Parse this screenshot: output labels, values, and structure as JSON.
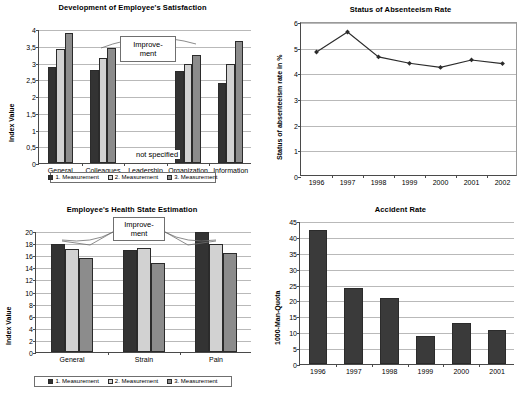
{
  "charts": [
    {
      "id": "employee-satisfaction",
      "title": "Development of Employee's Satisfaction",
      "ylabel": "Index Value",
      "annotation": "Improve-\nment",
      "annotation_line1": "Improve-",
      "annotation_line2": "ment",
      "note": "not specified",
      "legend": [
        "1. Measurement",
        "2. Measurement",
        "3. Measurement"
      ],
      "yticks": [
        "0",
        "0,5",
        "1",
        "1,5",
        "2",
        "2,5",
        "3",
        "3,5",
        "4"
      ],
      "chart_data": {
        "type": "bar",
        "title": "Development of Employee's Satisfaction",
        "xlabel": "",
        "ylabel": "Index Value",
        "ylim": [
          0,
          4
        ],
        "grid": true,
        "legend_position": "bottom",
        "categories": [
          "General",
          "Colleagues",
          "Leadership",
          "Organization",
          "Information"
        ],
        "series": [
          {
            "name": "1. Measurement",
            "color": "#333333",
            "values": [
              2.88,
              2.79,
              null,
              2.76,
              2.4
            ]
          },
          {
            "name": "2. Measurement",
            "color": "#d2d2d2",
            "values": [
              3.39,
              3.13,
              null,
              2.96,
              2.95
            ]
          },
          {
            "name": "3. Measurement",
            "color": "#8c8c8c",
            "values": [
              3.89,
              3.43,
              null,
              3.22,
              3.64
            ]
          }
        ]
      }
    },
    {
      "id": "absenteeism-rate",
      "title": "Status of Absenteeism Rate",
      "ylabel": "Status of absenteeism rate in %",
      "yticks": [
        "0",
        "1",
        "2",
        "3",
        "4",
        "5",
        "6"
      ],
      "chart_data": {
        "type": "line",
        "title": "Status of Absenteeism Rate",
        "xlabel": "",
        "ylabel": "Status of absenteeism rate in %",
        "ylim": [
          0,
          6
        ],
        "grid": true,
        "legend_position": "none",
        "marker": "diamond",
        "color": "#2b2b2b",
        "categories": [
          "1996",
          "1997",
          "1998",
          "1999",
          "2000",
          "2001",
          "2002"
        ],
        "values": [
          4.87,
          5.65,
          4.68,
          4.43,
          4.27,
          4.56,
          4.42
        ]
      }
    },
    {
      "id": "health-state",
      "title": "Employee's Health State Estimation",
      "ylabel": "Index Value",
      "annotation_line1": "Improve-",
      "annotation_line2": "ment",
      "legend": [
        "1. Measurement",
        "2. Measurement",
        "3. Measurement"
      ],
      "yticks": [
        "0",
        "2",
        "4",
        "6",
        "8",
        "10",
        "12",
        "14",
        "16",
        "18",
        "20"
      ],
      "chart_data": {
        "type": "bar",
        "title": "Employee's Health State Estimation",
        "xlabel": "",
        "ylabel": "Index Value",
        "ylim": [
          0,
          20
        ],
        "grid": true,
        "legend_position": "bottom",
        "categories": [
          "General",
          "Strain",
          "Pain"
        ],
        "series": [
          {
            "name": "1. Measurement",
            "color": "#333333",
            "values": [
              17.9,
              16.8,
              19.9
            ]
          },
          {
            "name": "2. Measurement",
            "color": "#d2d2d2",
            "values": [
              17.0,
              17.2,
              17.9
            ]
          },
          {
            "name": "3. Measurement",
            "color": "#8c8c8c",
            "values": [
              15.5,
              14.7,
              16.4
            ]
          }
        ]
      }
    },
    {
      "id": "accident-rate",
      "title": "Accident Rate",
      "ylabel": "1000-Man-Quota",
      "yticks": [
        "0",
        "5",
        "10",
        "15",
        "20",
        "25",
        "30",
        "35",
        "40",
        "45"
      ],
      "chart_data": {
        "type": "bar",
        "title": "Accident Rate",
        "xlabel": "",
        "ylabel": "1000-Man-Quota",
        "ylim": [
          0,
          45
        ],
        "grid": true,
        "legend_position": "none",
        "categories": [
          "1996",
          "1997",
          "1998",
          "1999",
          "2000",
          "2001"
        ],
        "series": [
          {
            "name": "1000-Man-Quota",
            "color": "#3a3a3a",
            "values": [
              42.1,
              23.9,
              20.9,
              8.9,
              12.9,
              10.8
            ]
          }
        ]
      }
    }
  ]
}
